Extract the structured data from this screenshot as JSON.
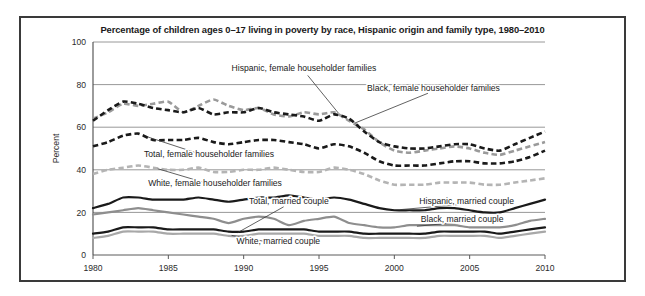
{
  "chart_data": {
    "type": "line",
    "title": "Percentage of children ages 0–17 living in poverty by race, Hispanic origin and family type, 1980–2010",
    "xlabel": "",
    "ylabel": "Percent",
    "ylim": [
      0,
      100
    ],
    "xlim": [
      1980,
      2010
    ],
    "yticks": [
      "0",
      "20",
      "40",
      "60",
      "80",
      "100"
    ],
    "ytick_values": [
      0,
      20,
      40,
      60,
      80,
      100
    ],
    "xticks": [
      "1980",
      "1985",
      "1990",
      "1995",
      "2000",
      "2005",
      "2010"
    ],
    "xtick_values": [
      1980,
      1985,
      1990,
      1995,
      2000,
      2005,
      2010
    ],
    "grid": true,
    "grid_axis": "y",
    "legend_position": "inline-annotations",
    "x": [
      1980,
      1981,
      1982,
      1983,
      1984,
      1985,
      1986,
      1987,
      1988,
      1989,
      1990,
      1991,
      1992,
      1993,
      1994,
      1995,
      1996,
      1997,
      1998,
      1999,
      2000,
      2001,
      2002,
      2003,
      2004,
      2005,
      2006,
      2007,
      2008,
      2009,
      2010
    ],
    "series": [
      {
        "name": "Hispanic, female householder families",
        "style": "dashed",
        "color": "#9a9a9a",
        "values": [
          64,
          67,
          71,
          70,
          71,
          72,
          67,
          70,
          73,
          70,
          68,
          69,
          66,
          65,
          67,
          66,
          67,
          63,
          59,
          53,
          49,
          48,
          49,
          50,
          51,
          50,
          48,
          47,
          49,
          51,
          53
        ]
      },
      {
        "name": "Black, female householder families",
        "style": "dashed",
        "color": "#1a1a1a",
        "values": [
          63,
          68,
          72,
          71,
          69,
          68,
          67,
          69,
          66,
          67,
          67,
          69,
          67,
          66,
          65,
          63,
          66,
          64,
          58,
          53,
          51,
          50,
          50,
          51,
          52,
          52,
          50,
          49,
          52,
          55,
          58
        ]
      },
      {
        "name": "Total, female householder families",
        "style": "dashed",
        "color": "#1a1a1a",
        "values": [
          51,
          53,
          56,
          57,
          54,
          54,
          54,
          55,
          53,
          52,
          53,
          54,
          54,
          53,
          52,
          50,
          52,
          51,
          48,
          44,
          42,
          42,
          42,
          43,
          44,
          44,
          43,
          43,
          44,
          46,
          49
        ]
      },
      {
        "name": "White, female householder families",
        "style": "dashed",
        "color": "#b4b4b4",
        "values": [
          38,
          40,
          41,
          42,
          41,
          40,
          40,
          41,
          39,
          39,
          40,
          40,
          41,
          40,
          39,
          39,
          41,
          40,
          38,
          35,
          33,
          33,
          33,
          34,
          34,
          34,
          33,
          33,
          34,
          35,
          36
        ]
      },
      {
        "name": "Hispanic, married couple",
        "style": "solid",
        "color": "#1a1a1a",
        "values": [
          22,
          24,
          27,
          27,
          26,
          26,
          26,
          27,
          26,
          25,
          26,
          27,
          27,
          28,
          27,
          26,
          27,
          26,
          24,
          22,
          21,
          21,
          21,
          22,
          22,
          21,
          20,
          20,
          22,
          24,
          26
        ]
      },
      {
        "name": "Black, married couple",
        "style": "solid",
        "color": "#8e8e8e",
        "values": [
          19,
          20,
          21,
          22,
          21,
          20,
          19,
          18,
          17,
          15,
          17,
          18,
          17,
          14,
          16,
          17,
          18,
          15,
          14,
          13,
          13,
          14,
          14,
          14,
          14,
          13,
          13,
          13,
          14,
          16,
          17
        ]
      },
      {
        "name": "Total, married couple",
        "style": "solid",
        "color": "#1a1a1a",
        "values": [
          10,
          11,
          13,
          13,
          13,
          12,
          12,
          12,
          12,
          11,
          11,
          12,
          12,
          12,
          12,
          11,
          11,
          11,
          10,
          10,
          10,
          10,
          10,
          11,
          11,
          11,
          11,
          10,
          11,
          12,
          13
        ]
      },
      {
        "name": "White, married couple",
        "style": "solid",
        "color": "#a8a8a8",
        "values": [
          8,
          9,
          11,
          11,
          11,
          10,
          10,
          10,
          10,
          9,
          9,
          10,
          10,
          10,
          10,
          9,
          9,
          9,
          8,
          8,
          8,
          8,
          8,
          9,
          9,
          9,
          9,
          8,
          9,
          10,
          11
        ]
      }
    ],
    "annotations": [
      {
        "label": "Hispanic, female householder families",
        "text_x": 1994.0,
        "text_y": 86.5,
        "anchor": "middle",
        "leader_to_x": 1996.3,
        "leader_to_y": 66.5
      },
      {
        "label": "Black, female householder families",
        "text_x": 2002.6,
        "text_y": 77.0,
        "anchor": "middle",
        "leader_to_x": 1997.4,
        "leader_to_y": 62.0
      },
      {
        "label": "Total, female householder families",
        "text_x": 1987.7,
        "text_y": 46.0,
        "anchor": "middle",
        "leader_to_x": 1983.6,
        "leader_to_y": 55.5
      },
      {
        "label": "White, female householder families",
        "text_x": 1988.1,
        "text_y": 32.5,
        "anchor": "middle",
        "leader_to_x": 1984.3,
        "leader_to_y": 40.5
      },
      {
        "label": "Total, married couple",
        "text_x": 1993.0,
        "text_y": 24.0,
        "anchor": "middle",
        "leader_to_x": 1989.6,
        "leader_to_y": 10.5
      },
      {
        "label": "Hispanic, married couple",
        "text_x": 2004.8,
        "text_y": 24.0,
        "anchor": "middle",
        "leader_to_x": 2000.4,
        "leader_to_y": 21.3
      },
      {
        "label": "Black, married couple",
        "text_x": 2004.5,
        "text_y": 15.5,
        "anchor": "middle",
        "leader_to_x": 2001.5,
        "leader_to_y": 13.5
      },
      {
        "label": "White, married couple",
        "text_x": 1992.3,
        "text_y": 5.2,
        "anchor": "middle",
        "leader_to_x": 1989.2,
        "leader_to_y": 9.2
      }
    ]
  }
}
